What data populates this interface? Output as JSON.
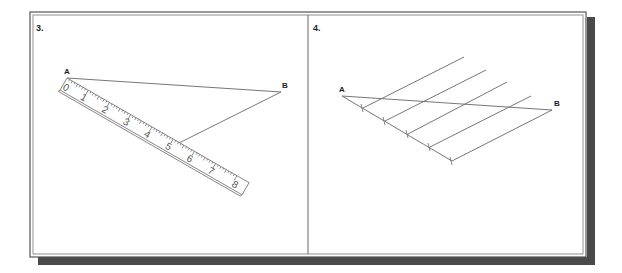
{
  "figure": {
    "colors": {
      "background": "#ffffff",
      "frame": "#555555",
      "shadow": "#4a4a4a",
      "line": "#666666",
      "label": "#222222"
    },
    "panels": [
      {
        "id": "3",
        "number_label": "3.",
        "point_a_label": "A",
        "point_b_label": "B",
        "description": "Line AB with a ruler placed from point A at an angle; a line drawn from B to the 5 mark on the ruler",
        "ruler": {
          "numbers": [
            "0",
            "1",
            "2",
            "3",
            "4",
            "5",
            "6",
            "7",
            "8"
          ],
          "marked_value": "5"
        }
      },
      {
        "id": "4",
        "number_label": "4.",
        "point_a_label": "A",
        "point_b_label": "B",
        "description": "Line AB divided into five equal parts by parallel lines drawn through equally spaced marks on an auxiliary line from A",
        "divisions": 5
      }
    ]
  }
}
